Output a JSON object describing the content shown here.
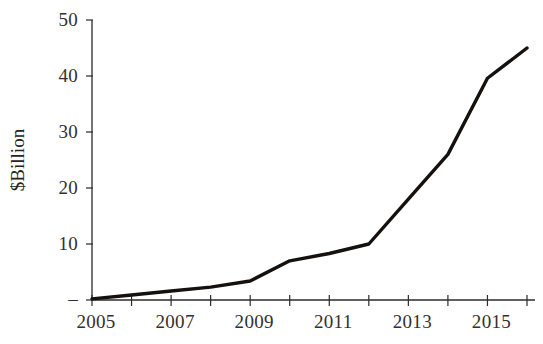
{
  "chart_data": {
    "type": "line",
    "title": "",
    "subtitle": "",
    "xlabel": "",
    "ylabel": "$Billion",
    "x": [
      2005,
      2006,
      2007,
      2008,
      2009,
      2010,
      2011,
      2012,
      2013,
      2014,
      2015,
      2016
    ],
    "values": [
      0.2,
      0.9,
      1.6,
      2.3,
      3.4,
      7.0,
      8.3,
      10.0,
      18.0,
      26.0,
      39.6,
      45.0
    ],
    "series": [
      {
        "name": "",
        "values": [
          0.2,
          0.9,
          1.6,
          2.3,
          3.4,
          7.0,
          8.3,
          10.0,
          18.0,
          26.0,
          39.6,
          45.0
        ]
      }
    ],
    "xlim": [
      2005,
      2016
    ],
    "ylim": [
      0,
      50
    ],
    "xticks": [
      2005,
      2006,
      2007,
      2008,
      2009,
      2010,
      2011,
      2012,
      2013,
      2014,
      2015,
      2016
    ],
    "xtick_labels": [
      "2005",
      "",
      "2007",
      "",
      "2009",
      "",
      "2011",
      "",
      "2013",
      "",
      "2015",
      ""
    ],
    "yticks": [
      0,
      10,
      20,
      30,
      40,
      50
    ],
    "ytick_labels": [
      "–",
      "10",
      "20",
      "30",
      "40",
      "50"
    ],
    "grid": false,
    "legend": false,
    "legend_position": "none",
    "line_color": "#15110f",
    "axis_color": "#2b2b2b",
    "background_color": "#ffffff",
    "annotations": []
  }
}
